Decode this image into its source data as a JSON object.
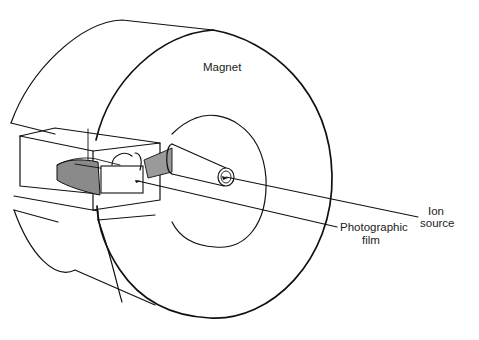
{
  "diagram": {
    "labels": {
      "magnet": "Magnet",
      "film_line1": "Photographic",
      "film_line2": "film",
      "ion_line1": "Ion",
      "ion_line2": "source"
    },
    "components": [
      "magnet",
      "ion source tube",
      "photographic film",
      "vacuum chamber box",
      "analyzer plate"
    ],
    "colors": {
      "stroke": "#111111",
      "shaded_plate": "#8a8a8a",
      "background": "#ffffff"
    }
  }
}
